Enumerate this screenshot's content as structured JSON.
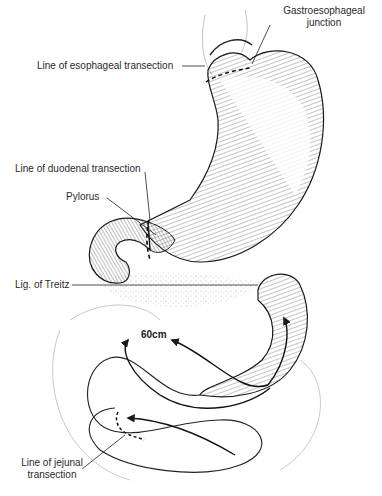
{
  "figure": {
    "labels": {
      "ge_junction_line1": "Gastroesophageal",
      "ge_junction_line2": "junction",
      "esophageal_transection": "Line of esophageal transection",
      "duodenal_transection": "Line of duodenal transection",
      "pylorus": "Pylorus",
      "lig_treitz": "Lig. of Treitz",
      "jejunal_transection_line1": "Line of jejunal",
      "jejunal_transection_line2": "transection"
    },
    "measurement": "60cm",
    "colors": {
      "ink": "#1a1a1a",
      "hatch": "#555555",
      "stipple": "#9a9a9a",
      "background": "#ffffff"
    }
  }
}
